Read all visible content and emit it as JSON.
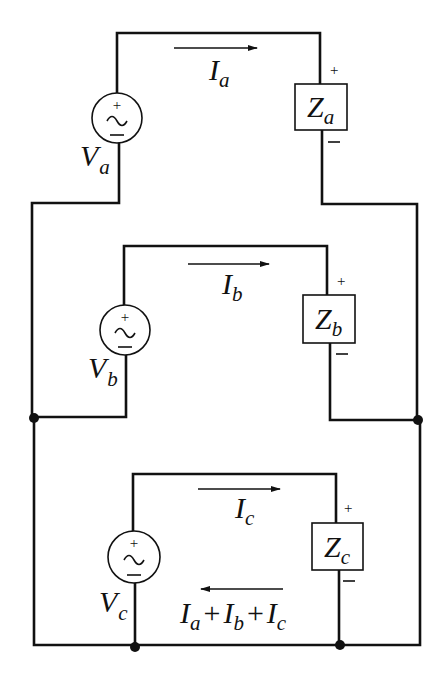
{
  "diagram": {
    "branches": [
      {
        "id": "a",
        "source": {
          "symbol": "V",
          "subscript": "a",
          "plus": "+",
          "minus": "−",
          "glyph": "~"
        },
        "impedance": {
          "symbol": "Z",
          "subscript": "a",
          "plus": "+",
          "minus": "−"
        },
        "current": {
          "symbol": "I",
          "subscript": "a",
          "direction": "right"
        }
      },
      {
        "id": "b",
        "source": {
          "symbol": "V",
          "subscript": "b",
          "plus": "+",
          "minus": "−",
          "glyph": "~"
        },
        "impedance": {
          "symbol": "Z",
          "subscript": "b",
          "plus": "+",
          "minus": "−"
        },
        "current": {
          "symbol": "I",
          "subscript": "b",
          "direction": "right"
        }
      },
      {
        "id": "c",
        "source": {
          "symbol": "V",
          "subscript": "c",
          "plus": "+",
          "minus": "−",
          "glyph": "~"
        },
        "impedance": {
          "symbol": "Z",
          "subscript": "c",
          "plus": "+",
          "minus": "−"
        },
        "current": {
          "symbol": "I",
          "subscript": "c",
          "direction": "right"
        }
      }
    ],
    "return_current": {
      "direction": "left",
      "terms": [
        {
          "symbol": "I",
          "subscript": "a"
        },
        {
          "symbol": "I",
          "subscript": "b"
        },
        {
          "symbol": "I",
          "subscript": "c"
        }
      ],
      "operator": "+"
    },
    "nodes": 4,
    "colors": {
      "line": "#111111",
      "background": "#ffffff"
    }
  }
}
